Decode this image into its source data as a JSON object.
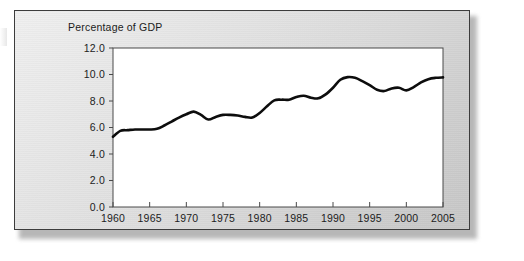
{
  "figure": {
    "name": "percentage-of-gdp-line-chart",
    "title": "Percentage of GDP",
    "background_color": "#dedede",
    "plot_background_color": "#ffffff",
    "frame_border_color": "#3c3c3c",
    "line_color": "#0d0d0d",
    "gridline_color": "#6b6b6b"
  },
  "chart_data": {
    "type": "line",
    "title": "Percentage of GDP",
    "subtitle": "",
    "xlabel": "",
    "ylabel": "",
    "xlim": [
      1960,
      2005
    ],
    "ylim": [
      0.0,
      12.0
    ],
    "grid": true,
    "legend_position": "none",
    "y_ticks": [
      "0.0",
      "2.0",
      "4.0",
      "6.0",
      "8.0",
      "10.0",
      "12.0"
    ],
    "y_tick_values": [
      0.0,
      2.0,
      4.0,
      6.0,
      8.0,
      10.0,
      12.0
    ],
    "x_ticks": [
      "1960",
      "1965",
      "1970",
      "1975",
      "1980",
      "1985",
      "1990",
      "1995",
      "2000",
      "2005"
    ],
    "x_tick_values": [
      1960,
      1965,
      1970,
      1975,
      1980,
      1985,
      1990,
      1995,
      2000,
      2005
    ],
    "series": [
      {
        "name": "Percentage of GDP",
        "x": [
          1960,
          1961,
          1962,
          1963,
          1964,
          1965,
          1966,
          1967,
          1968,
          1969,
          1970,
          1971,
          1972,
          1973,
          1974,
          1975,
          1976,
          1977,
          1978,
          1979,
          1980,
          1981,
          1982,
          1983,
          1984,
          1985,
          1986,
          1987,
          1988,
          1989,
          1990,
          1991,
          1992,
          1993,
          1994,
          1995,
          1996,
          1997,
          1998,
          1999,
          2000,
          2001,
          2002,
          2003,
          2004,
          2005
        ],
        "values": [
          5.3,
          5.75,
          5.8,
          5.85,
          5.85,
          5.85,
          5.9,
          6.15,
          6.45,
          6.75,
          7.0,
          7.2,
          6.95,
          6.6,
          6.8,
          6.95,
          6.95,
          6.9,
          6.8,
          6.75,
          7.1,
          7.6,
          8.05,
          8.1,
          8.1,
          8.3,
          8.4,
          8.25,
          8.2,
          8.5,
          9.0,
          9.6,
          9.8,
          9.75,
          9.5,
          9.2,
          8.85,
          8.75,
          8.95,
          9.0,
          8.8,
          9.05,
          9.4,
          9.65,
          9.75,
          9.78
        ]
      }
    ]
  },
  "axes_geometry": {
    "plot_left_px": 113,
    "plot_right_px": 443,
    "plot_top_px": 48,
    "plot_bottom_px": 207
  }
}
